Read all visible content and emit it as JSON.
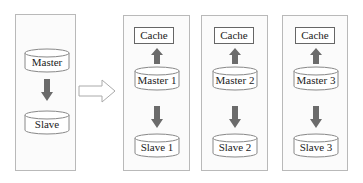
{
  "diagram": {
    "before": {
      "master_label": "Master",
      "slave_label": "Slave"
    },
    "transition_arrow": "hollow-right-arrow",
    "after": [
      {
        "cache_label": "Cache",
        "master_label": "Master 1",
        "slave_label": "Slave 1"
      },
      {
        "cache_label": "Cache",
        "master_label": "Master 2",
        "slave_label": "Slave 2"
      },
      {
        "cache_label": "Cache",
        "master_label": "Master 3",
        "slave_label": "Slave 3"
      }
    ],
    "colors": {
      "arrow_fill": "#6b6b6b",
      "panel_border": "#b9b9b9",
      "cylinder_stroke": "#888888"
    }
  }
}
